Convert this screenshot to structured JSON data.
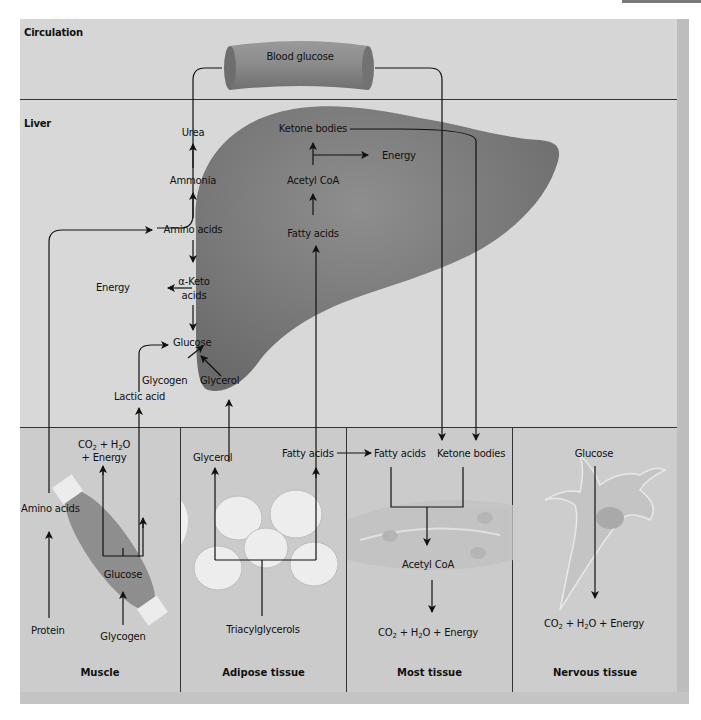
{
  "sections": {
    "circulation": {
      "title": "Circulation",
      "vessel_label": "Blood glucose"
    },
    "liver": {
      "title": "Liver",
      "labels": {
        "urea": "Urea",
        "ammonia": "Ammonia",
        "amino_acids": "Amino acids",
        "energy_left": "Energy",
        "alpha_keto": "α-Keto",
        "acids": "acids",
        "glucose": "Glucose",
        "glycogen": "Glycogen",
        "glycerol": "Glycerol",
        "lactic_acid": "Lactic acid",
        "ketone_bodies": "Ketone bodies",
        "energy_right": "Energy",
        "acetyl_coa": "Acetyl CoA",
        "fatty_acids": "Fatty acids"
      }
    },
    "muscle": {
      "title": "Muscle",
      "labels": {
        "co2_h2o": "CO2 + H2O",
        "plus_energy": "+ Energy",
        "amino_acids": "Amino acids",
        "glucose": "Glucose",
        "protein": "Protein",
        "glycogen": "Glycogen"
      }
    },
    "adipose": {
      "title": "Adipose tissue",
      "labels": {
        "glycerol": "Glycerol",
        "fatty_acids": "Fatty acids",
        "triacylglycerols": "Triacylglycerols"
      }
    },
    "most": {
      "title": "Most tissue",
      "labels": {
        "fatty_acids": "Fatty acids",
        "ketone_bodies": "Ketone bodies",
        "acetyl_coa": "Acetyl CoA",
        "products": "CO2 + H2O + Energy"
      }
    },
    "nervous": {
      "title": "Nervous tissue",
      "labels": {
        "glucose": "Glucose",
        "products": "CO2 + H2O + Energy"
      }
    }
  },
  "colors": {
    "frame_bg": "#d4d4d4",
    "liver_fill": "#7c7c7c",
    "vessel_fill": "#8a8a8a",
    "muscle_fill": "#8e8e8e",
    "line": "#111111"
  }
}
